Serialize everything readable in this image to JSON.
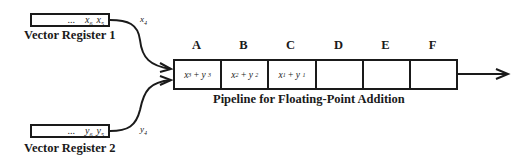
{
  "diagram": {
    "title": "Pipeline for Floating-Point Addition",
    "registers": [
      {
        "label": "Vector Register 1",
        "var": "x",
        "contents": [
          "...",
          "x6",
          "x5"
        ],
        "elements": [
          {
            "base": "x",
            "sub": "6"
          },
          {
            "base": "x",
            "sub": "5"
          }
        ],
        "output": {
          "base": "x",
          "sub": "4"
        }
      },
      {
        "label": "Vector Register 2",
        "var": "y",
        "contents": [
          "...",
          "y6",
          "y5"
        ],
        "elements": [
          {
            "base": "y",
            "sub": "6"
          },
          {
            "base": "y",
            "sub": "5"
          }
        ],
        "output": {
          "base": "y",
          "sub": "4"
        }
      }
    ],
    "ellipsis": "...",
    "stages": [
      {
        "label": "A",
        "content": {
          "a": "x",
          "a_sub": "3",
          "op": "+",
          "b": "y",
          "b_sub": "3"
        }
      },
      {
        "label": "B",
        "content": {
          "a": "x",
          "a_sub": "2",
          "op": "+",
          "b": "y",
          "b_sub": "2"
        }
      },
      {
        "label": "C",
        "content": {
          "a": "x",
          "a_sub": "1",
          "op": "+",
          "b": "y",
          "b_sub": "1"
        }
      },
      {
        "label": "D",
        "content": null
      },
      {
        "label": "E",
        "content": null
      },
      {
        "label": "F",
        "content": null
      }
    ],
    "colors": {
      "stroke": "#1a1a1a",
      "background": "#ffffff"
    }
  }
}
